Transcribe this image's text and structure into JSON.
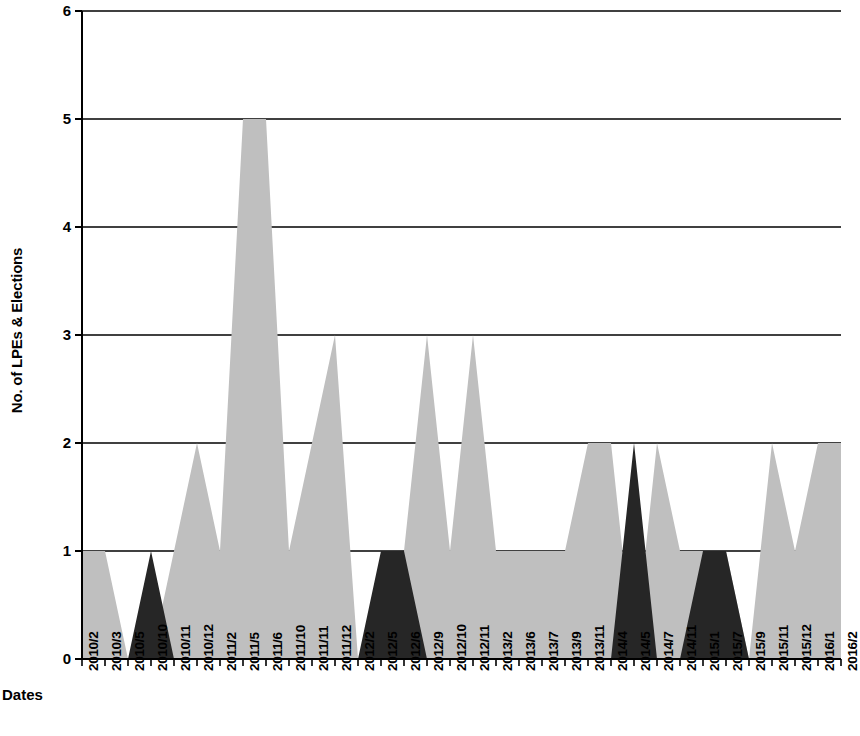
{
  "chart_data": {
    "type": "area",
    "title": "",
    "xlabel": "Dates",
    "ylabel": "No. of LPEs & Elections",
    "ylim": [
      0,
      6
    ],
    "y_ticks": [
      0,
      1,
      2,
      3,
      4,
      5,
      6
    ],
    "grid": true,
    "grid_axis": "y",
    "legend": "none",
    "stacked": false,
    "categories": [
      "2010/2",
      "2010/3",
      "2010/5",
      "2010/10",
      "2010/11",
      "2010/12",
      "2011/2",
      "2011/5",
      "2011/6",
      "2011/10",
      "2011/11",
      "2011/12",
      "2012/2",
      "2012/5",
      "2012/6",
      "2012/9",
      "2012/10",
      "2012/11",
      "2013/2",
      "2013/6",
      "2013/7",
      "2013/9",
      "2013/11",
      "2014/4",
      "2014/5",
      "2014/7",
      "2014/11",
      "2015/1",
      "2015/7",
      "2015/9",
      "2015/11",
      "2015/12",
      "2016/1",
      "2016/2"
    ],
    "series": [
      {
        "name": "LPEs",
        "color": "#bfbfbf",
        "values": [
          1,
          1,
          0,
          0,
          1,
          2,
          1,
          5,
          5,
          1,
          2,
          3,
          0,
          0,
          1,
          3,
          1,
          3,
          1,
          1,
          1,
          1,
          2,
          2,
          0,
          2,
          1,
          1,
          1,
          0,
          2,
          1,
          2,
          2
        ]
      },
      {
        "name": "Elections",
        "color": "#262626",
        "values": [
          0,
          0,
          0,
          1,
          0,
          0,
          0,
          0,
          0,
          0,
          0,
          0,
          0,
          1,
          1,
          0,
          0,
          0,
          0,
          0,
          0,
          0,
          0,
          0,
          2,
          0,
          0,
          1,
          1,
          0,
          0,
          0,
          0,
          0
        ]
      }
    ]
  },
  "axes": {
    "y_tick_labels": [
      "6",
      "5",
      "4",
      "3",
      "2",
      "1",
      "0"
    ],
    "y_title": "No. of LPEs & Elections",
    "x_title": "Dates"
  },
  "colors": {
    "series_light": "#bfbfbf",
    "series_dark": "#262626",
    "axis": "#000000",
    "grid": "#000000",
    "background": "#ffffff"
  }
}
